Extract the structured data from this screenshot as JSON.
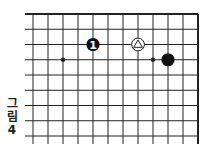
{
  "figure": {
    "caption_lines": [
      "그",
      "림",
      "4"
    ],
    "caption": "그림 4"
  },
  "board": {
    "type": "go-board-fragment",
    "columns_visible": 12,
    "rows_visible": 9,
    "edges": [
      "top",
      "right"
    ],
    "line_color": "#222222",
    "star_points": [
      {
        "col": 2,
        "row": 3
      },
      {
        "col": 8,
        "row": 3
      }
    ],
    "stones": [
      {
        "color": "black",
        "col": 4,
        "row": 2,
        "label": "1"
      },
      {
        "color": "white",
        "col": 7,
        "row": 2,
        "mark": "triangle"
      },
      {
        "color": "black",
        "col": 9,
        "row": 3,
        "label": ""
      }
    ]
  }
}
